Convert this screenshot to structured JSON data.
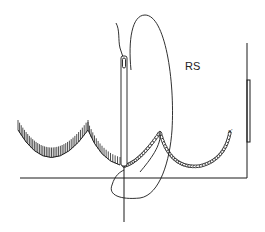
{
  "diagram": {
    "labels": {
      "right_side": "RS",
      "small_mark": "a'"
    },
    "elements": [
      "needle",
      "working-thread-loop",
      "blanket-stitch-scallops",
      "chain-stitch-scallops",
      "fabric-baseline",
      "fabric-edge-bracket"
    ],
    "colors": {
      "ink": "#1a1a1a",
      "background": "#ffffff"
    }
  }
}
